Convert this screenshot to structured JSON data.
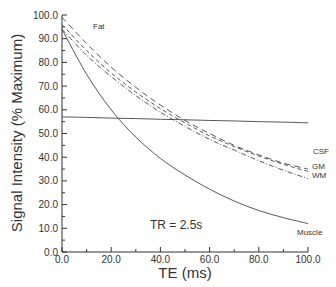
{
  "chart_data": {
    "type": "line",
    "title": "",
    "xlabel": "TE (ms)",
    "ylabel": "Signal Intensity (% Maximum)",
    "xlim": [
      0,
      100
    ],
    "ylim": [
      0,
      100
    ],
    "x_ticks": [
      "0.0",
      "20.0",
      "40.0",
      "60.0",
      "80.0",
      "100.0"
    ],
    "y_ticks": [
      "0.0",
      "10.0",
      "20.0",
      "30.0",
      "40.0",
      "50.0",
      "60.0",
      "70.0",
      "80.0",
      "90.0",
      "100.0"
    ],
    "grid": false,
    "legend": "inline labels at curve ends",
    "annotation": "TR = 2.5s",
    "x": [
      0,
      10,
      20,
      30,
      40,
      50,
      60,
      70,
      80,
      90,
      100
    ],
    "series": [
      {
        "name": "Fat",
        "style": "long-dash",
        "values": [
          99,
          88,
          78,
          69.5,
          62,
          55.5,
          50,
          45,
          41,
          37.5,
          35
        ]
      },
      {
        "name": "GM",
        "style": "short-dash",
        "values": [
          96,
          85,
          75.5,
          67.5,
          60.5,
          54.5,
          49,
          44.5,
          40.5,
          37,
          34
        ]
      },
      {
        "name": "WM",
        "style": "dash-dot",
        "values": [
          94,
          83,
          74,
          66,
          59,
          53,
          47.5,
          43,
          38.5,
          34.5,
          31
        ]
      },
      {
        "name": "CSF",
        "style": "solid",
        "values": [
          57,
          56.8,
          56.5,
          56.3,
          56,
          55.8,
          55.5,
          55.3,
          55,
          54.8,
          54.5
        ]
      },
      {
        "name": "Muscle",
        "style": "solid",
        "values": [
          94,
          75,
          60,
          48.5,
          39.5,
          32.5,
          26.5,
          21.5,
          17.5,
          14.5,
          12
        ]
      }
    ]
  },
  "labels": {
    "xlabel": "TE  (ms)",
    "ylabel": "Signal Intensity  (% Maximum)",
    "annotation": "TR  =  2.5s",
    "fat": "Fat",
    "csf": "CSF",
    "gm": "GM",
    "wm": "WM",
    "muscle": "Muscle"
  }
}
